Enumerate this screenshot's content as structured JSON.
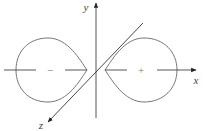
{
  "diagram": {
    "title": "",
    "axes": {
      "x": {
        "label": "x"
      },
      "y": {
        "label": "y"
      },
      "z": {
        "label": "z"
      }
    },
    "lobes": [
      {
        "name": "left-lobe",
        "sign": "−"
      },
      {
        "name": "right-lobe",
        "sign": "+"
      }
    ],
    "colors": {
      "line": "#555555",
      "axis": "#333333",
      "background": "#ffffff"
    }
  }
}
